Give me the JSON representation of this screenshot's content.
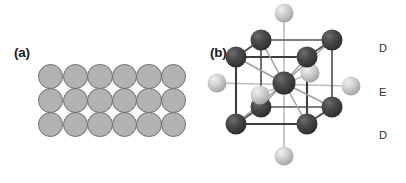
{
  "figure": {
    "background_color": "#ffffff",
    "width": 406,
    "height": 183
  },
  "panels": {
    "a": {
      "label": "(a)",
      "description": "close-packed plane of spheres",
      "sphere_color": "#b2b2b2",
      "sphere_outline_color": "#6f6f6f",
      "rows": 3,
      "columns": 6,
      "sphere_count": 18,
      "sphere_diameter_px": 25.4
    },
    "b": {
      "label": "(b)",
      "description": "body centred cubic unit cell with octahedral interstitial atoms",
      "dark_atom_color": "#3f3f3f",
      "light_atom_color": "#cfcfcf",
      "edge_color": "#4a4a4a",
      "axis_color": "#b9b9b9",
      "dark_atom_count": 9,
      "light_atom_count": 6
    }
  },
  "level_labels": {
    "top": "D",
    "middle": "E",
    "bottom": "D"
  },
  "chart_data": {
    "type": "diagram",
    "title": "",
    "subtitle": "",
    "panels": [
      {
        "id": "a",
        "label": "(a)",
        "kind": "sphere-packing-layer",
        "lattice": "square",
        "rows": 3,
        "columns": 6,
        "positions": [
          [
            0,
            0
          ],
          [
            1,
            0
          ],
          [
            2,
            0
          ],
          [
            3,
            0
          ],
          [
            4,
            0
          ],
          [
            5,
            0
          ],
          [
            0,
            1
          ],
          [
            1,
            1
          ],
          [
            2,
            1
          ],
          [
            3,
            1
          ],
          [
            4,
            1
          ],
          [
            5,
            1
          ],
          [
            0,
            2
          ],
          [
            1,
            2
          ],
          [
            2,
            2
          ],
          [
            3,
            2
          ],
          [
            4,
            2
          ],
          [
            5,
            2
          ]
        ],
        "sphere_fill": "#b2b2b2",
        "sphere_stroke": "#6f6f6f"
      },
      {
        "id": "b",
        "label": "(b)",
        "kind": "bcc-unit-cell",
        "dark_atoms": [
          {
            "name": "corner-front-top-left",
            "x": 33,
            "y": 57,
            "r": 10.5
          },
          {
            "name": "corner-front-top-right",
            "x": 104,
            "y": 57,
            "r": 10.5
          },
          {
            "name": "corner-back-top-left",
            "x": 58,
            "y": 40,
            "r": 10.5
          },
          {
            "name": "corner-back-top-right",
            "x": 129,
            "y": 40,
            "r": 10.5
          },
          {
            "name": "corner-front-bottom-left",
            "x": 33,
            "y": 124,
            "r": 10.5
          },
          {
            "name": "corner-front-bottom-right",
            "x": 104,
            "y": 124,
            "r": 10.5
          },
          {
            "name": "corner-back-bottom-left",
            "x": 58,
            "y": 107,
            "r": 10.5
          },
          {
            "name": "corner-back-bottom-right",
            "x": 129,
            "y": 107,
            "r": 10.5
          },
          {
            "name": "body-centre",
            "x": 81,
            "y": 83,
            "r": 11.5
          }
        ],
        "light_atoms": [
          {
            "name": "axis-up",
            "x": 81,
            "y": 13,
            "r": 9.5
          },
          {
            "name": "axis-down",
            "x": 81,
            "y": 156,
            "r": 9.5
          },
          {
            "name": "axis-left",
            "x": 14,
            "y": 83,
            "r": 9.5
          },
          {
            "name": "axis-right",
            "x": 148,
            "y": 86,
            "r": 9.5
          },
          {
            "name": "axis-back",
            "x": 107,
            "y": 73,
            "r": 9.5
          },
          {
            "name": "axis-front",
            "x": 57,
            "y": 95,
            "r": 9.5
          }
        ],
        "edge_color": "#4a4a4a",
        "axis_color": "#b9b9b9",
        "bond_color": "#9a9a9a"
      }
    ],
    "annotations": [
      {
        "text": "D",
        "x": 379,
        "y": 48,
        "meaning": "layer level D (upper)"
      },
      {
        "text": "E",
        "x": 379,
        "y": 92,
        "meaning": "layer level E (middle)"
      },
      {
        "text": "D",
        "x": 379,
        "y": 135,
        "meaning": "layer level D (lower)"
      }
    ]
  }
}
